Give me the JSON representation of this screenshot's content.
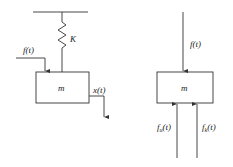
{
  "left_diagram": {
    "spring_label": "K",
    "mass_label": "m",
    "force_label": "f(t)",
    "displacement_label": "x(t)"
  },
  "right_diagram": {
    "mass_label": "m",
    "force_label": "f(t)",
    "damping_force_label": {
      "base": "f",
      "sub": "u",
      "arg": "(t)"
    },
    "spring_force_label": {
      "base": "f",
      "sub": "k",
      "arg": "(t)"
    }
  },
  "colors": {
    "line": "#333333",
    "text": "#222222",
    "background": "#ffffff"
  }
}
